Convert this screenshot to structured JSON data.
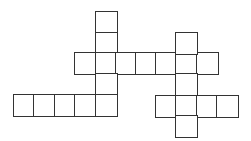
{
  "puzzle": {
    "type": "crossword-grid",
    "cell_size_px": 20.3,
    "line_color": "#333333",
    "background": "#ffffff",
    "cells": [
      {
        "x": 96,
        "y": 12
      },
      {
        "x": 96,
        "y": 33
      },
      {
        "x": 75,
        "y": 53
      },
      {
        "x": 96,
        "y": 53
      },
      {
        "x": 116,
        "y": 53
      },
      {
        "x": 136,
        "y": 53
      },
      {
        "x": 156,
        "y": 53
      },
      {
        "x": 176,
        "y": 53
      },
      {
        "x": 197,
        "y": 53
      },
      {
        "x": 96,
        "y": 74
      },
      {
        "x": 14,
        "y": 95
      },
      {
        "x": 34,
        "y": 95
      },
      {
        "x": 55,
        "y": 95
      },
      {
        "x": 75,
        "y": 95
      },
      {
        "x": 96,
        "y": 95
      },
      {
        "x": 176,
        "y": 33
      },
      {
        "x": 176,
        "y": 74
      },
      {
        "x": 156,
        "y": 96
      },
      {
        "x": 176,
        "y": 96
      },
      {
        "x": 197,
        "y": 96
      },
      {
        "x": 217,
        "y": 96
      },
      {
        "x": 176,
        "y": 116
      }
    ],
    "words": [
      {
        "id": "down-1",
        "direction": "down",
        "length": 5
      },
      {
        "id": "across-1",
        "direction": "across",
        "length": 7
      },
      {
        "id": "down-2",
        "direction": "down",
        "length": 5
      },
      {
        "id": "across-2",
        "direction": "across",
        "length": 5
      },
      {
        "id": "across-3",
        "direction": "across",
        "length": 4
      }
    ]
  }
}
